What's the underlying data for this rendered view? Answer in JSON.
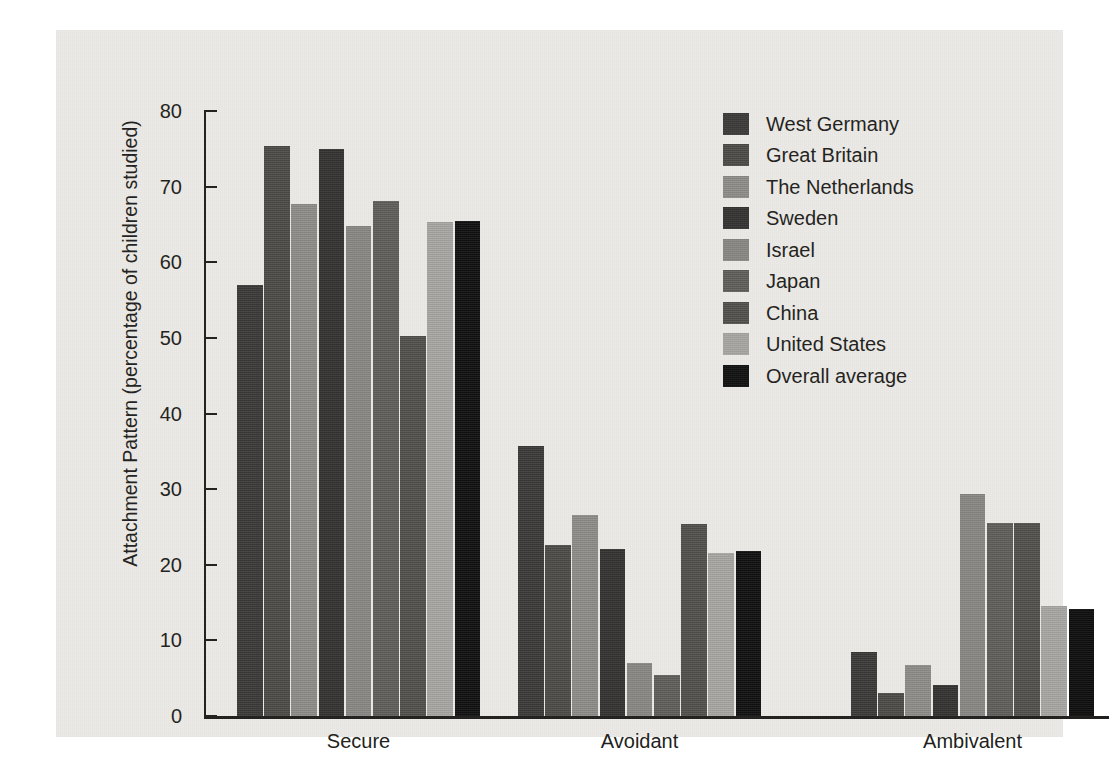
{
  "chart_data": {
    "type": "bar",
    "title": "",
    "xlabel": "",
    "ylabel": "Attachment Pattern (percentage of children studied)",
    "categories": [
      "Secure",
      "Avoidant",
      "Ambivalent"
    ],
    "ylim": [
      0,
      80
    ],
    "yticks": [
      0,
      10,
      20,
      30,
      40,
      50,
      60,
      70,
      80
    ],
    "ytick_labels": [
      "0",
      "10",
      "20",
      "30",
      "40",
      "50",
      "60",
      "70",
      "80"
    ],
    "grid": false,
    "legend_position": "top-right",
    "series": [
      {
        "name": "West Germany",
        "color": "#3b3a38",
        "values": [
          57.0,
          35.7,
          8.5
        ]
      },
      {
        "name": "Great Britain",
        "color": "#4c4b48",
        "values": [
          75.4,
          22.6,
          3.0
        ]
      },
      {
        "name": "The Netherlands",
        "color": "#8f8d89",
        "values": [
          67.7,
          26.6,
          6.7
        ]
      },
      {
        "name": "Sweden",
        "color": "#343331",
        "values": [
          75.0,
          22.1,
          4.1
        ]
      },
      {
        "name": "Israel",
        "color": "#8a8884",
        "values": [
          64.8,
          7.0,
          29.3
        ]
      },
      {
        "name": "Japan",
        "color": "#5f5e5b",
        "values": [
          68.1,
          5.4,
          25.5
        ]
      },
      {
        "name": "China",
        "color": "#51504d",
        "values": [
          50.3,
          25.4,
          25.5
        ]
      },
      {
        "name": "United States",
        "color": "#a9a7a3",
        "values": [
          65.3,
          21.5,
          14.6
        ]
      },
      {
        "name": "Overall average",
        "color": "#111010",
        "values": [
          65.5,
          21.8,
          14.2
        ]
      }
    ]
  },
  "axis": {
    "y_label": "Attachment Pattern (percentage of children studied)"
  },
  "legend": {
    "items": [
      {
        "label": "West Germany"
      },
      {
        "label": "Great Britain"
      },
      {
        "label": "The Netherlands"
      },
      {
        "label": "Sweden"
      },
      {
        "label": "Israel"
      },
      {
        "label": "Japan"
      },
      {
        "label": "China"
      },
      {
        "label": "United States"
      },
      {
        "label": "Overall average"
      }
    ]
  }
}
